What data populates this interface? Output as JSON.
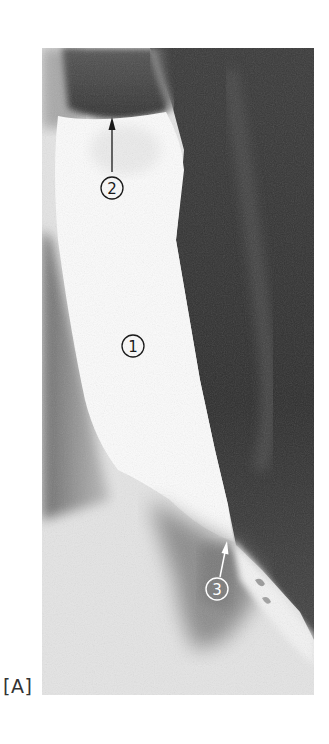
{
  "figure": {
    "panel_label": "[A]",
    "image_description": "Barium swallow radiograph showing dilated esophagus with tapered lower end",
    "annotations": [
      {
        "id": "1",
        "label": "1",
        "arrow": false
      },
      {
        "id": "2",
        "label": "2",
        "arrow": true,
        "arrow_color": "#1a1a1a"
      },
      {
        "id": "3",
        "label": "3",
        "arrow": true,
        "arrow_color": "#ffffff"
      }
    ]
  }
}
